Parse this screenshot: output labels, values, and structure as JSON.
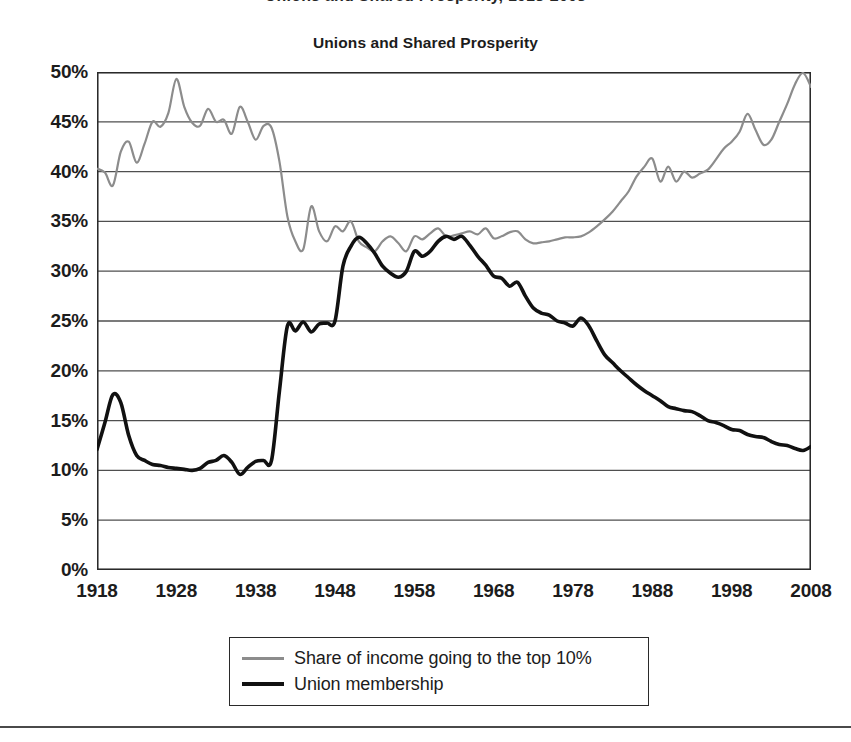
{
  "page": {
    "cropped_header_text": "Unions and Shared Prosperity, 1918-2008"
  },
  "chart_data": {
    "type": "line",
    "title": "Unions and Shared Prosperity",
    "xlabel": "",
    "ylabel": "",
    "xlim": [
      1918,
      2008
    ],
    "ylim": [
      0,
      50
    ],
    "grid": true,
    "legend_position": "bottom",
    "y_ticks": [
      "0%",
      "5%",
      "10%",
      "15%",
      "20%",
      "25%",
      "30%",
      "35%",
      "40%",
      "45%",
      "50%"
    ],
    "y_tick_values": [
      0,
      5,
      10,
      15,
      20,
      25,
      30,
      35,
      40,
      45,
      50
    ],
    "x_ticks": [
      "1918",
      "1928",
      "1938",
      "1948",
      "1958",
      "1968",
      "1978",
      "1988",
      "1998",
      "2008"
    ],
    "x_tick_values": [
      1918,
      1928,
      1938,
      1948,
      1958,
      1968,
      1978,
      1988,
      1998,
      2008
    ],
    "colors": {
      "share_of_income": "#8c8c8c",
      "union_membership": "#111111",
      "axis": "#2a2a2a",
      "grid": "#4f4f4f"
    },
    "series": [
      {
        "name": "Share of income going to the top 10%",
        "color": "#8c8c8c",
        "x": [
          1918,
          1919,
          1920,
          1921,
          1922,
          1923,
          1924,
          1925,
          1926,
          1927,
          1928,
          1929,
          1930,
          1931,
          1932,
          1933,
          1934,
          1935,
          1936,
          1937,
          1938,
          1939,
          1940,
          1941,
          1942,
          1943,
          1944,
          1945,
          1946,
          1947,
          1948,
          1949,
          1950,
          1951,
          1952,
          1953,
          1954,
          1955,
          1956,
          1957,
          1958,
          1959,
          1960,
          1961,
          1962,
          1963,
          1964,
          1965,
          1966,
          1967,
          1968,
          1969,
          1970,
          1971,
          1972,
          1973,
          1974,
          1975,
          1976,
          1977,
          1978,
          1979,
          1980,
          1981,
          1982,
          1983,
          1984,
          1985,
          1986,
          1987,
          1988,
          1989,
          1990,
          1991,
          1992,
          1993,
          1994,
          1995,
          1996,
          1997,
          1998,
          1999,
          2000,
          2001,
          2002,
          2003,
          2004,
          2005,
          2006,
          2007,
          2008
        ],
        "values": [
          40.3,
          39.9,
          38.6,
          42.0,
          43.0,
          40.9,
          42.8,
          45.0,
          44.5,
          45.9,
          49.3,
          46.5,
          44.9,
          44.6,
          46.3,
          45.0,
          45.2,
          43.8,
          46.5,
          45.0,
          43.2,
          44.6,
          44.4,
          41.0,
          35.5,
          33.0,
          32.2,
          36.5,
          34.0,
          33.0,
          34.5,
          34.0,
          35.0,
          33.0,
          32.4,
          32.0,
          33.0,
          33.5,
          32.8,
          32.0,
          33.5,
          33.2,
          33.8,
          34.3,
          33.5,
          33.6,
          33.8,
          34.0,
          33.7,
          34.3,
          33.3,
          33.5,
          33.9,
          34.0,
          33.2,
          32.8,
          32.9,
          33.0,
          33.2,
          33.4,
          33.4,
          33.5,
          33.9,
          34.5,
          35.2,
          36.0,
          37.0,
          38.0,
          39.5,
          40.5,
          41.3,
          39.0,
          40.5,
          39.0,
          40.0,
          39.4,
          39.8,
          40.2,
          41.2,
          42.3,
          43.0,
          44.0,
          45.8,
          44.2,
          42.7,
          43.2,
          45.0,
          46.8,
          48.8,
          49.9,
          48.5
        ]
      },
      {
        "name": "Union membership",
        "color": "#111111",
        "x": [
          1918,
          1919,
          1920,
          1921,
          1922,
          1923,
          1924,
          1925,
          1926,
          1927,
          1928,
          1929,
          1930,
          1931,
          1932,
          1933,
          1934,
          1935,
          1936,
          1937,
          1938,
          1939,
          1940,
          1941,
          1942,
          1943,
          1944,
          1945,
          1946,
          1947,
          1948,
          1949,
          1950,
          1951,
          1952,
          1953,
          1954,
          1955,
          1956,
          1957,
          1958,
          1959,
          1960,
          1961,
          1962,
          1963,
          1964,
          1965,
          1966,
          1967,
          1968,
          1969,
          1970,
          1971,
          1972,
          1973,
          1974,
          1975,
          1976,
          1977,
          1978,
          1979,
          1980,
          1981,
          1982,
          1983,
          1984,
          1985,
          1986,
          1987,
          1988,
          1989,
          1990,
          1991,
          1992,
          1993,
          1994,
          1995,
          1996,
          1997,
          1998,
          1999,
          2000,
          2001,
          2002,
          2003,
          2004,
          2005,
          2006,
          2007,
          2008
        ],
        "values": [
          12.1,
          14.8,
          17.6,
          16.8,
          13.5,
          11.5,
          11.0,
          10.6,
          10.5,
          10.3,
          10.2,
          10.1,
          10.0,
          10.2,
          10.8,
          11.0,
          11.5,
          10.8,
          9.6,
          10.3,
          10.9,
          11.0,
          11.0,
          18.0,
          24.5,
          24.0,
          24.9,
          23.9,
          24.7,
          24.8,
          25.0,
          30.5,
          32.5,
          33.4,
          32.8,
          31.8,
          30.5,
          29.8,
          29.4,
          30.0,
          32.0,
          31.5,
          32.0,
          33.0,
          33.5,
          33.2,
          33.5,
          32.6,
          31.5,
          30.6,
          29.5,
          29.3,
          28.5,
          28.9,
          27.5,
          26.3,
          25.8,
          25.6,
          25.0,
          24.8,
          24.5,
          25.3,
          24.5,
          23.0,
          21.6,
          20.8,
          20.0,
          19.3,
          18.6,
          18.0,
          17.5,
          17.0,
          16.4,
          16.2,
          16.0,
          15.9,
          15.5,
          15.0,
          14.8,
          14.5,
          14.1,
          14.0,
          13.6,
          13.4,
          13.3,
          12.9,
          12.6,
          12.5,
          12.2,
          12.0,
          12.4
        ]
      }
    ]
  },
  "legend": {
    "items": [
      {
        "label": "Share of income going to the top 10%",
        "color": "#8c8c8c",
        "weight": "thin"
      },
      {
        "label": "Union membership",
        "color": "#111111",
        "weight": "thick"
      }
    ]
  }
}
